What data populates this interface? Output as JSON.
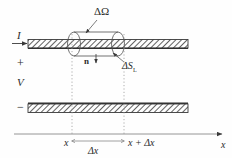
{
  "figure": {
    "background_color": "#fefefe",
    "ink_color": "#3a3a3a",
    "labels": {
      "delta_omega": "ΔΩ",
      "current": "I",
      "plus": "+",
      "voltage": "V",
      "minus": "−",
      "normal_vector": "n",
      "delta_s_lateral_main": "ΔS",
      "delta_s_lateral_sub": "L",
      "x_left": "x",
      "x_right": "x + Δx",
      "delta_x": "Δx",
      "axis_x": "x"
    },
    "elements": {
      "top_conductor": "hatched-band",
      "bottom_conductor": "hatched-band",
      "volume_element": "cylinder",
      "x_axis": "arrow-line",
      "guides": "dotted-vertical-lines"
    }
  }
}
